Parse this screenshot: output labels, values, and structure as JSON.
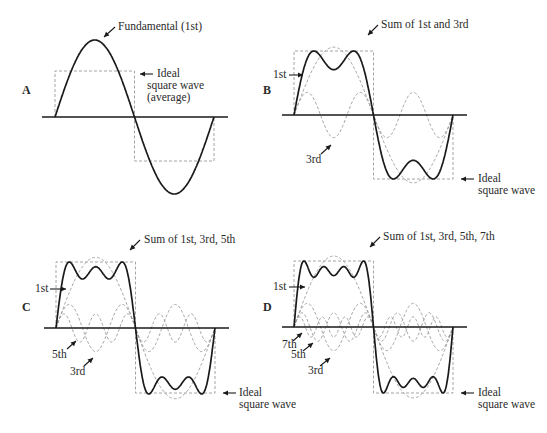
{
  "panels": [
    {
      "id": "A",
      "letter": "A",
      "letter_pos": [
        22,
        94
      ],
      "axis": {
        "x1": 42,
        "x2": 228,
        "y": 117
      },
      "wave": {
        "x0": 55,
        "x1": 214,
        "amp": 77
      },
      "ideal": {
        "top": 71,
        "bottom": 161
      },
      "harmonics_summed": [
        1
      ],
      "harmonics_shown": [],
      "labels": [
        {
          "text": "Fundamental (1st)",
          "x": 118,
          "y": 30
        },
        {
          "text": "Ideal",
          "x": 157,
          "y": 77
        },
        {
          "text": "square wave",
          "x": 147,
          "y": 89
        },
        {
          "text": "(average)",
          "x": 147,
          "y": 101
        }
      ],
      "arrows": [
        {
          "from": [
            115,
            27
          ],
          "to": [
            104,
            37
          ]
        },
        {
          "from": [
            153,
            74
          ],
          "to": [
            140,
            74
          ]
        }
      ]
    },
    {
      "id": "B",
      "letter": "B",
      "letter_pos": [
        263,
        94
      ],
      "axis": {
        "x1": 282,
        "x2": 467,
        "y": 115
      },
      "wave": {
        "x0": 294,
        "x1": 453,
        "amp": 64
      },
      "ideal": {
        "top": 51,
        "bottom": 179
      },
      "harmonics_summed": [
        1,
        3
      ],
      "harmonics_shown": [
        1,
        3
      ],
      "labels": [
        {
          "text": "Sum of 1st and 3rd",
          "x": 381,
          "y": 28
        },
        {
          "text": "1st",
          "x": 273,
          "y": 78
        },
        {
          "text": "3rd",
          "x": 306,
          "y": 163
        },
        {
          "text": "Ideal",
          "x": 478,
          "y": 182
        },
        {
          "text": "square wave",
          "x": 478,
          "y": 194
        }
      ],
      "arrows": [
        {
          "from": [
            378,
            25
          ],
          "to": [
            368,
            35
          ]
        },
        {
          "from": [
            289,
            75
          ],
          "to": [
            303,
            75
          ]
        },
        {
          "from": [
            321,
            154
          ],
          "to": [
            331,
            145
          ]
        },
        {
          "from": [
            474,
            179
          ],
          "to": [
            461,
            179
          ]
        }
      ]
    },
    {
      "id": "C",
      "letter": "C",
      "letter_pos": [
        22,
        311
      ],
      "axis": {
        "x1": 44,
        "x2": 229,
        "y": 328
      },
      "wave": {
        "x0": 56,
        "x1": 215,
        "amp": 66
      },
      "ideal": {
        "top": 262,
        "bottom": 393
      },
      "harmonics_summed": [
        1,
        3,
        5
      ],
      "harmonics_shown": [
        1,
        3,
        5
      ],
      "labels": [
        {
          "text": "Sum of 1st, 3rd, 5th",
          "x": 144,
          "y": 243
        },
        {
          "text": "1st",
          "x": 35,
          "y": 292
        },
        {
          "text": "5th",
          "x": 52,
          "y": 358
        },
        {
          "text": "3rd",
          "x": 70,
          "y": 375
        },
        {
          "text": "Ideal",
          "x": 239,
          "y": 396
        },
        {
          "text": "square wave",
          "x": 239,
          "y": 408
        }
      ],
      "arrows": [
        {
          "from": [
            140,
            240
          ],
          "to": [
            130,
            250
          ]
        },
        {
          "from": [
            50,
            289
          ],
          "to": [
            66,
            289
          ]
        },
        {
          "from": [
            67,
            349
          ],
          "to": [
            76,
            341
          ]
        },
        {
          "from": [
            84,
            366
          ],
          "to": [
            93,
            358
          ]
        },
        {
          "from": [
            236,
            393
          ],
          "to": [
            223,
            393
          ]
        }
      ]
    },
    {
      "id": "D",
      "letter": "D",
      "letter_pos": [
        263,
        311
      ],
      "axis": {
        "x1": 282,
        "x2": 467,
        "y": 327
      },
      "wave": {
        "x0": 294,
        "x1": 453,
        "amp": 66
      },
      "ideal": {
        "top": 261,
        "bottom": 393
      },
      "harmonics_summed": [
        1,
        3,
        5,
        7
      ],
      "harmonics_shown": [
        1,
        3,
        5,
        7
      ],
      "labels": [
        {
          "text": "Sum of 1st, 3rd, 5th, 7th",
          "x": 383,
          "y": 240
        },
        {
          "text": "1st",
          "x": 273,
          "y": 290
        },
        {
          "text": "7th",
          "x": 282,
          "y": 348
        },
        {
          "text": "5th",
          "x": 291,
          "y": 358
        },
        {
          "text": "3rd",
          "x": 308,
          "y": 374
        },
        {
          "text": "Ideal",
          "x": 478,
          "y": 396
        },
        {
          "text": "square wave",
          "x": 478,
          "y": 408
        }
      ],
      "arrows": [
        {
          "from": [
            380,
            237
          ],
          "to": [
            370,
            247
          ]
        },
        {
          "from": [
            289,
            287
          ],
          "to": [
            305,
            287
          ]
        },
        {
          "from": [
            293,
            341
          ],
          "to": [
            302,
            333
          ]
        },
        {
          "from": [
            303,
            351
          ],
          "to": [
            313,
            343
          ]
        },
        {
          "from": [
            320,
            366
          ],
          "to": [
            330,
            358
          ]
        },
        {
          "from": [
            474,
            393
          ],
          "to": [
            461,
            393
          ]
        }
      ]
    }
  ],
  "colors": {
    "sum_wave": "#1a1a1a",
    "harmonic_dashed": "#9a9a9a",
    "ideal_square_dashed": "#9a9a9a",
    "axis": "#1a1a1a",
    "background": "#ffffff"
  }
}
